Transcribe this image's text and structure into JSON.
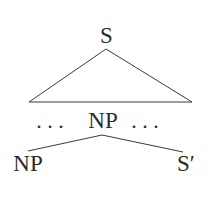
{
  "diagram": {
    "type": "syntax-tree",
    "nodes": {
      "root": {
        "label": "S",
        "x": 106.5,
        "y": 43
      },
      "middle": {
        "label": "NP",
        "x": 103,
        "y": 128
      },
      "left_ellipsis": {
        "label": ". . .",
        "x": 50,
        "y": 128
      },
      "right_ellipsis": {
        "label": ". . .",
        "x": 145,
        "y": 128
      },
      "bottom_left": {
        "label": "NP",
        "x": 28,
        "y": 171
      },
      "bottom_right": {
        "label": "S′",
        "x": 186,
        "y": 171
      }
    },
    "edges": {
      "triangle": {
        "apex": [
          106,
          49
        ],
        "left": [
          29,
          102
        ],
        "right": [
          192,
          102
        ]
      },
      "branch_left": {
        "from": [
          102,
          135
        ],
        "to": [
          28,
          151
        ]
      },
      "branch_right": {
        "from": [
          102,
          135
        ],
        "to": [
          183,
          152
        ]
      }
    }
  }
}
